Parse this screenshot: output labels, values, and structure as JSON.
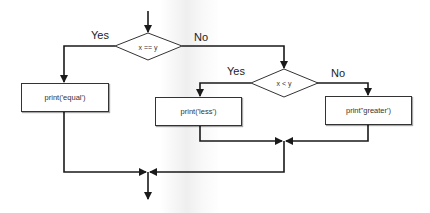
{
  "diagram": {
    "type": "flowchart",
    "decisions": [
      {
        "id": "d1",
        "text": "x == y",
        "yes_label": "Yes",
        "no_label": "No"
      },
      {
        "id": "d2",
        "text": "x < y",
        "yes_label": "Yes",
        "no_label": "No"
      }
    ],
    "processes": [
      {
        "id": "p1",
        "text": "print('equal')"
      },
      {
        "id": "p2",
        "text": "print('less')"
      },
      {
        "id": "p3",
        "text": "print\"greater')"
      }
    ],
    "edges": [
      {
        "from": "start",
        "to": "d1"
      },
      {
        "from": "d1",
        "to": "p1",
        "label": "Yes"
      },
      {
        "from": "d1",
        "to": "d2",
        "label": "No"
      },
      {
        "from": "d2",
        "to": "p2",
        "label": "Yes"
      },
      {
        "from": "d2",
        "to": "p3",
        "label": "No"
      },
      {
        "from": "p2",
        "to": "merge2"
      },
      {
        "from": "p3",
        "to": "merge2"
      },
      {
        "from": "merge2",
        "to": "merge1"
      },
      {
        "from": "p1",
        "to": "merge1"
      },
      {
        "from": "merge1",
        "to": "end"
      }
    ]
  },
  "colors": {
    "line": "#1a1a1a",
    "box_border": "#333333",
    "background": "#ffffff"
  }
}
